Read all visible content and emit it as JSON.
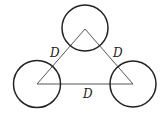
{
  "diagram": {
    "colors": {
      "stroke": "#222222",
      "line": "#555555",
      "background": "#ffffff"
    },
    "circles": [
      {
        "name": "top",
        "cx": 85,
        "cy": 28,
        "r": 23
      },
      {
        "name": "left",
        "cx": 37,
        "cy": 84,
        "r": 23.5
      },
      {
        "name": "right",
        "cx": 133,
        "cy": 84,
        "r": 23
      }
    ],
    "triangle": {
      "points": "85,29 37,84 133,84"
    },
    "labels": {
      "left_side": "D",
      "right_side": "D",
      "bottom_side": "D"
    }
  }
}
